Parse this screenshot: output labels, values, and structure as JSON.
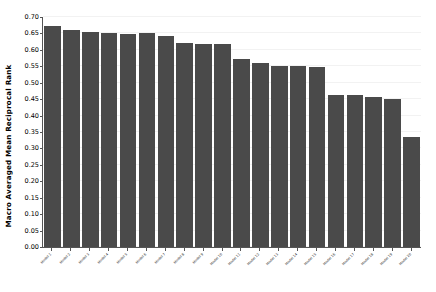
{
  "chart_data": {
    "type": "bar",
    "title": "",
    "xlabel": "",
    "ylabel": "Macro Averaged Mean Reciprocal Rank",
    "ylim": [
      0.0,
      0.7
    ],
    "ytick_labels": [
      "0.00",
      "0.05",
      "0.10",
      "0.15",
      "0.20",
      "0.25",
      "0.30",
      "0.35",
      "0.40",
      "0.45",
      "0.50",
      "0.55",
      "0.60",
      "0.65",
      "0.70"
    ],
    "ytick_values": [
      0.0,
      0.05,
      0.1,
      0.15,
      0.2,
      0.25,
      0.3,
      0.35,
      0.4,
      0.45,
      0.5,
      0.55,
      0.6,
      0.65,
      0.7
    ],
    "grid": true,
    "legend": false,
    "bar_color": "#4a4a4a",
    "background_color": "#ffffff",
    "categories": [
      "Model 1",
      "Model 2",
      "Model 3",
      "Model 4",
      "Model 5",
      "Model 6",
      "Model 7",
      "Model 8",
      "Model 9",
      "Model 10",
      "Model 11",
      "Model 12",
      "Model 13",
      "Model 14",
      "Model 15",
      "Model 16",
      "Model 17",
      "Model 18",
      "Model 19",
      "Model 20"
    ],
    "values": [
      0.672,
      0.661,
      0.653,
      0.65,
      0.649,
      0.65,
      0.643,
      0.62,
      0.619,
      0.618,
      0.573,
      0.561,
      0.551,
      0.551,
      0.548,
      0.463,
      0.462,
      0.457,
      0.451,
      0.334
    ],
    "values_extra": [
      0.332
    ]
  }
}
